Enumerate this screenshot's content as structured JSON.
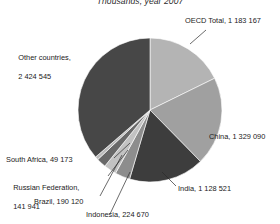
{
  "chart_data": {
    "type": "pie",
    "title": "Thousands, year 2007",
    "xlabel": "",
    "ylabel": "",
    "units": "Thousands",
    "year": "2007",
    "legend_position": "callout-labels",
    "grid": false,
    "total": 6387227,
    "categories": [
      "OECD Total",
      "China",
      "India",
      "Indonesia",
      "Brazil",
      "Russian Federation",
      "South Africa",
      "Other countries"
    ],
    "values": [
      1183167,
      1329090,
      1128521,
      224670,
      190120,
      141941,
      49173,
      2424545
    ],
    "value_labels": [
      "1 183 167",
      "1 329 090",
      "1 128 521",
      "224 670",
      "190 120",
      "141 941",
      "49 173",
      "2 424 545"
    ],
    "colors": [
      "#b4b4b4",
      "#a0a0a0",
      "#3d3d3d",
      "#8d8d8d",
      "#c2c2c2",
      "#686868",
      "#b9b9b9",
      "#474747"
    ],
    "slices": [
      {
        "name": "OECD Total",
        "label": "OECD Total, 1 183 167",
        "value": 1183167,
        "percent": 18.5,
        "color": "#b4b4b4"
      },
      {
        "name": "China",
        "label": "China, 1 329 090",
        "value": 1329090,
        "percent": 20.8,
        "color": "#a0a0a0"
      },
      {
        "name": "India",
        "label": "India, 1 128 521",
        "value": 1128521,
        "percent": 17.7,
        "color": "#3d3d3d"
      },
      {
        "name": "Indonesia",
        "label": "Indonesia, 224 670",
        "value": 224670,
        "percent": 3.5,
        "color": "#8d8d8d"
      },
      {
        "name": "Brazil",
        "label": "Brazil, 190 120",
        "value": 190120,
        "percent": 3.0,
        "color": "#c2c2c2"
      },
      {
        "name": "Russian Federation",
        "label": "Russian Federation, 141 941",
        "value": 141941,
        "percent": 2.2,
        "color": "#686868"
      },
      {
        "name": "South Africa",
        "label": "South Africa, 49 173",
        "value": 49173,
        "percent": 0.8,
        "color": "#b9b9b9"
      },
      {
        "name": "Other countries",
        "label": "Other countries, 2 424 545",
        "value": 2424545,
        "percent": 38.0,
        "color": "#474747"
      }
    ]
  },
  "labels": {
    "title": "Thousands, year 2007",
    "oecd_total": "OECD Total, 1 183 167",
    "china": "China, 1 329 090",
    "india": "India, 1 128 521",
    "indonesia": "Indonesia, 224 670",
    "brazil": "Brazil, 190 120",
    "russian_federation_line1": "Russian Federation,",
    "russian_federation_line2": "141 941",
    "south_africa": "South Africa, 49 173",
    "other_countries_line1": "Other countries,",
    "other_countries_line2": "2 424 545"
  }
}
